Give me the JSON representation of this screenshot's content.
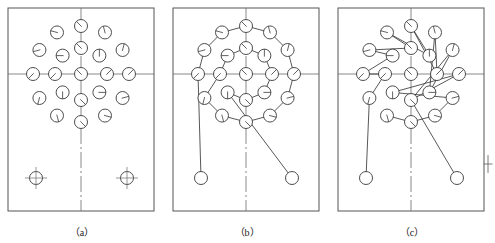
{
  "figure": {
    "panel_count": 3
  },
  "captions": {
    "a": "（a）",
    "b": "（b）",
    "c": "（c）"
  },
  "colors": {
    "stroke": "#3a3a3a",
    "centerline": "#6b6b6b",
    "border": "#555555",
    "background": "#ffffff",
    "caption_text": "#1a1a1a"
  },
  "panels": [
    {
      "id": "a",
      "label": "（a）",
      "description": "Hole layout only: two concentric rings of holes plus two datum holes at bottom",
      "frame": {
        "x": 8,
        "y": 8,
        "w": 146,
        "h": 203
      },
      "center": {
        "x": 81,
        "y": 74
      },
      "centerlines": {
        "horizontal_y": 74,
        "vertical_x": 81
      },
      "rings": [
        {
          "name": "outer-ring",
          "radius": 48,
          "count": 12,
          "hole_radius": 6.5,
          "start_angle_deg": -90
        },
        {
          "name": "inner-ring",
          "radius": 26,
          "count": 8,
          "hole_radius": 6.5,
          "start_angle_deg": -90
        }
      ],
      "datum_holes": [
        {
          "x": 36,
          "y": 178,
          "r": 6.5,
          "marker": "crosshair"
        },
        {
          "x": 127,
          "y": 178,
          "r": 6.5,
          "marker": "crosshair"
        }
      ],
      "path": {
        "enabled": false,
        "arrows": 0
      }
    },
    {
      "id": "b",
      "label": "（b）",
      "description": "Ring-sequential tool path: outer ring traversed then inner ring, entry from lower-left datum hole, exit arrow to lower-right datum hole",
      "frame": {
        "x": 173,
        "y": 8,
        "w": 146,
        "h": 203
      },
      "center": {
        "x": 246,
        "y": 74
      },
      "centerlines": {
        "horizontal_y": 74,
        "vertical_x": 246
      },
      "rings": [
        {
          "name": "outer-ring",
          "radius": 48,
          "count": 12,
          "hole_radius": 6.5,
          "start_angle_deg": -90
        },
        {
          "name": "inner-ring",
          "radius": 26,
          "count": 8,
          "hole_radius": 6.5,
          "start_angle_deg": -90
        }
      ],
      "datum_holes": [
        {
          "x": 201,
          "y": 178,
          "r": 6.5,
          "marker": "plain",
          "role": "start"
        },
        {
          "x": 292,
          "y": 178,
          "r": 6.5,
          "marker": "plain",
          "role": "end"
        }
      ],
      "path": {
        "enabled": true,
        "style": "ring-sequential",
        "arrows": 1,
        "entry_from": {
          "x": 201,
          "y": 178
        },
        "exit_to": {
          "x": 292,
          "y": 178
        }
      }
    },
    {
      "id": "c",
      "label": "（c）",
      "description": "Optimised zig-zag tool path crossing between inner and outer rings, arrow in from lower-left datum hole and arrow out to lower-right datum hole",
      "frame": {
        "x": 338,
        "y": 8,
        "w": 146,
        "h": 203
      },
      "center": {
        "x": 411,
        "y": 74
      },
      "centerlines": {
        "horizontal_y": 74,
        "vertical_x": 411
      },
      "rings": [
        {
          "name": "outer-ring",
          "radius": 48,
          "count": 12,
          "hole_radius": 6.5,
          "start_angle_deg": -90
        },
        {
          "name": "inner-ring",
          "radius": 26,
          "count": 8,
          "hole_radius": 6.5,
          "start_angle_deg": -90
        }
      ],
      "datum_holes": [
        {
          "x": 366,
          "y": 178,
          "r": 6.5,
          "marker": "plain",
          "role": "start"
        },
        {
          "x": 457,
          "y": 178,
          "r": 6.5,
          "marker": "plain",
          "role": "end"
        }
      ],
      "path": {
        "enabled": true,
        "style": "zig-zag-cross-ring",
        "arrows": 2,
        "entry_from": {
          "x": 366,
          "y": 178
        },
        "exit_to": {
          "x": 457,
          "y": 178
        }
      }
    }
  ],
  "edge_marker": {
    "name": "registration-crosshair",
    "x": 488,
    "y": 164,
    "size": 9
  }
}
